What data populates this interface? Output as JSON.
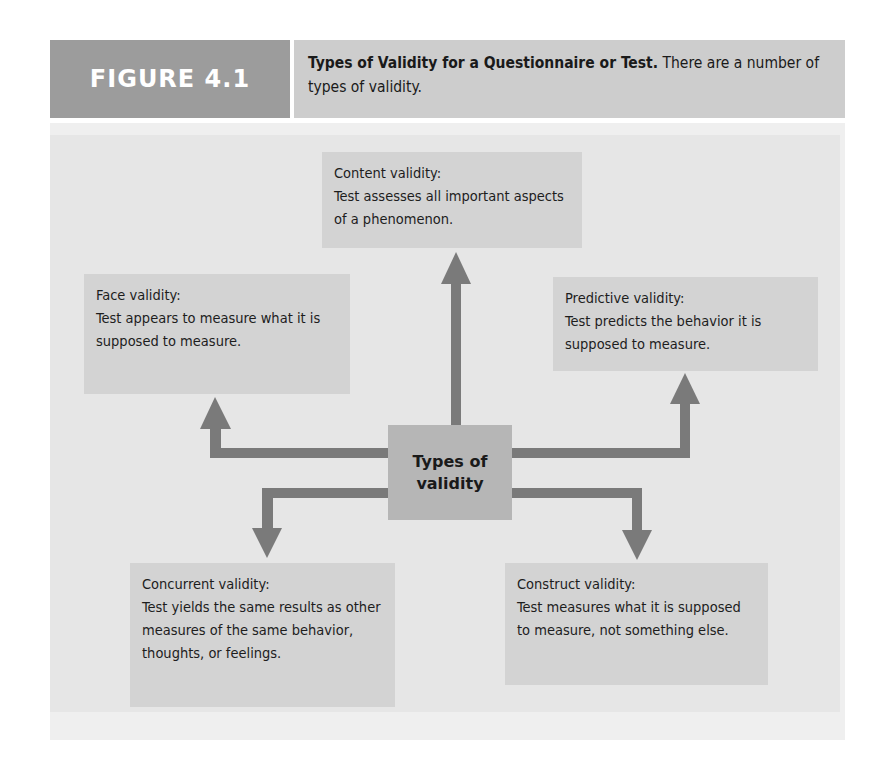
{
  "header": {
    "figure_label": "FIGURE 4.1",
    "caption_title": "Types of Validity for a Questionnaire or Test.",
    "caption_text": "There are a number of types of validity."
  },
  "diagram": {
    "center": {
      "line1": "Types of",
      "line2": "validity"
    },
    "nodes": [
      {
        "id": "content",
        "title": "Content validity:",
        "description": "Test assesses all important aspects of a phenomenon."
      },
      {
        "id": "face",
        "title": "Face validity:",
        "description": "Test appears to measure what it is supposed to measure."
      },
      {
        "id": "predictive",
        "title": "Predictive validity:",
        "description": "Test predicts the behavior it is supposed to measure."
      },
      {
        "id": "concurrent",
        "title": "Concurrent validity:",
        "description": "Test yields the same results as other measures of the same behavior, thoughts, or feelings."
      },
      {
        "id": "construct",
        "title": "Construct validity:",
        "description": "Test measures what it is supposed to measure, not something else."
      }
    ]
  },
  "colors": {
    "header_label_bg": "#9c9c9c",
    "header_caption_bg": "#cdcdcd",
    "panel_bg": "#efefef",
    "box_bg": "#d3d3d3",
    "center_bg": "#b6b6b6",
    "arrow": "#7a7a7a"
  }
}
